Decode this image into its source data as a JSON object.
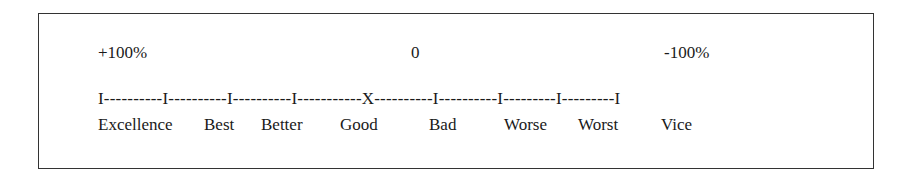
{
  "diagram": {
    "type": "value-scale",
    "top_labels": {
      "left": "+100%",
      "center": "0",
      "right": "-100%"
    },
    "scale_line": "I----------I----------I----------I-----------X----------I----------I---------I---------I",
    "categories": [
      "Excellence",
      "Best",
      "Better",
      "Good",
      "Bad",
      "Worse",
      "Worst",
      "Vice"
    ],
    "center_marker": "X"
  }
}
